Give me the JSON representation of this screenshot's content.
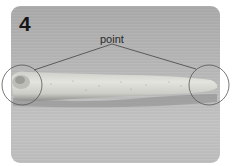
{
  "figure": {
    "step_number": "4",
    "annotation_label": "point",
    "colors": {
      "background": "#b5b5b5",
      "roll": "#dcdcd6",
      "annotation_lines": "#444444",
      "number": "#161616"
    }
  }
}
